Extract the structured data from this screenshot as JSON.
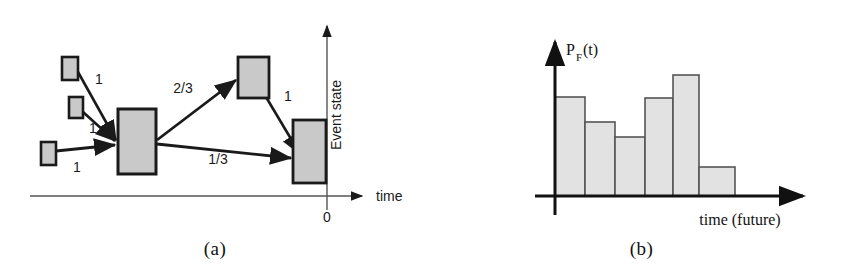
{
  "figure": {
    "background_color": "#ffffff",
    "box_fill_color": "#c9c9c9",
    "box_stroke_color": "#1a1a1a",
    "line_color": "#1a1a1a"
  },
  "panel_a": {
    "caption": "(a)",
    "x_axis_label": "time",
    "y_axis_label": "Event state",
    "origin_label": "0",
    "nodes": [
      {
        "id": "n1",
        "name": "small-box-top-left",
        "x": 62,
        "y": 57,
        "w": 16,
        "h": 23
      },
      {
        "id": "n2",
        "name": "small-box-middle-left",
        "x": 69,
        "y": 97,
        "w": 14,
        "h": 21
      },
      {
        "id": "n3",
        "name": "small-box-bottom-left",
        "x": 41,
        "y": 142,
        "w": 15,
        "h": 23
      },
      {
        "id": "n4",
        "name": "large-box-center",
        "x": 118,
        "y": 109,
        "w": 38,
        "h": 65
      },
      {
        "id": "n5",
        "name": "box-upper-right",
        "x": 238,
        "y": 57,
        "w": 31,
        "h": 41
      },
      {
        "id": "n6",
        "name": "box-far-right",
        "x": 293,
        "y": 120,
        "w": 33,
        "h": 63
      }
    ],
    "edges": [
      {
        "from": "n1",
        "to": "n4",
        "weight": "1",
        "label_x": 99,
        "label_y": 84
      },
      {
        "from": "n2",
        "to": "n4",
        "weight": "1",
        "label_x": 93,
        "label_y": 133
      },
      {
        "from": "n3",
        "to": "n4",
        "weight": "1",
        "label_x": 77,
        "label_y": 172
      },
      {
        "from": "n4",
        "to": "n5",
        "weight": "2/3",
        "label_x": 183,
        "label_y": 93
      },
      {
        "from": "n4",
        "to": "n6",
        "weight": "1/3",
        "label_x": 218,
        "label_y": 164
      },
      {
        "from": "n5",
        "to": "n6",
        "weight": "1",
        "label_x": 288,
        "label_y": 100
      }
    ],
    "axes": {
      "x_start": 30,
      "x_end": 368,
      "x_y": 196,
      "y_x": 327,
      "y_top": 22,
      "y_bottom": 210
    }
  },
  "panel_b": {
    "caption": "(b)",
    "x_axis_label": "time (future)",
    "y_axis_label_base": "P",
    "y_axis_label_sub": "F",
    "y_axis_label_tail": "(t)",
    "axes": {
      "x_start": 105,
      "x_end": 330,
      "x_y": 196,
      "y_x": 124,
      "y_top": 38,
      "y_bottom": 215
    }
  },
  "chart_data": {
    "type": "bar",
    "xlabel": "time (future)",
    "ylabel": "P_F(t)",
    "categories": [
      "1",
      "2",
      "3",
      "4",
      "5",
      "6"
    ],
    "values": [
      0.99,
      0.74,
      0.59,
      0.98,
      1.21,
      0.29
    ],
    "bar_pixel_tops": [
      97,
      122,
      137,
      98,
      75,
      167
    ],
    "bar_pixel_edges": [
      555,
      585,
      615,
      645,
      673,
      699,
      735
    ],
    "baseline_pixel_y": 196,
    "bar_fill": "#e2e2e2",
    "bar_stroke": "#555555",
    "grid": false,
    "legend": null,
    "ylim": [
      0,
      1.35
    ]
  }
}
